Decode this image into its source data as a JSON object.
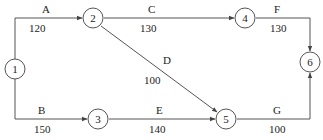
{
  "diagram": {
    "type": "activity-network",
    "nodes": [
      {
        "id": "1",
        "label": "1",
        "x": 15,
        "y": 69
      },
      {
        "id": "2",
        "label": "2",
        "x": 93,
        "y": 18
      },
      {
        "id": "3",
        "label": "3",
        "x": 98,
        "y": 119
      },
      {
        "id": "4",
        "label": "4",
        "x": 245,
        "y": 18
      },
      {
        "id": "5",
        "label": "5",
        "x": 226,
        "y": 119
      },
      {
        "id": "6",
        "label": "6",
        "x": 310,
        "y": 62
      }
    ],
    "edges": [
      {
        "name": "A",
        "value": "120",
        "from": "1",
        "to": "2"
      },
      {
        "name": "B",
        "value": "150",
        "from": "1",
        "to": "3"
      },
      {
        "name": "C",
        "value": "130",
        "from": "2",
        "to": "4"
      },
      {
        "name": "D",
        "value": "100",
        "from": "2",
        "to": "5"
      },
      {
        "name": "E",
        "value": "140",
        "from": "3",
        "to": "5"
      },
      {
        "name": "F",
        "value": "130",
        "from": "4",
        "to": "6"
      },
      {
        "name": "G",
        "value": "100",
        "from": "5",
        "to": "6"
      }
    ]
  },
  "colors": {
    "line": "#555555",
    "text": "#222222",
    "background": "#ffffff"
  }
}
